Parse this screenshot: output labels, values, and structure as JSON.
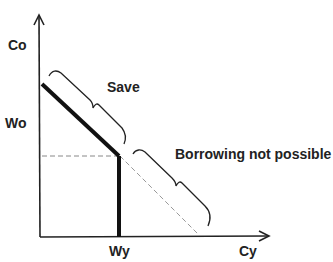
{
  "diagram": {
    "axes": {
      "y_label": "Co",
      "x_label": "Cy"
    },
    "ticks": {
      "wo": "Wo",
      "wy": "Wy"
    },
    "annotations": {
      "save": "Save",
      "borrowing": "Borrowing not possible"
    },
    "colors": {
      "line": "#111111",
      "dashed": "#888888"
    }
  }
}
